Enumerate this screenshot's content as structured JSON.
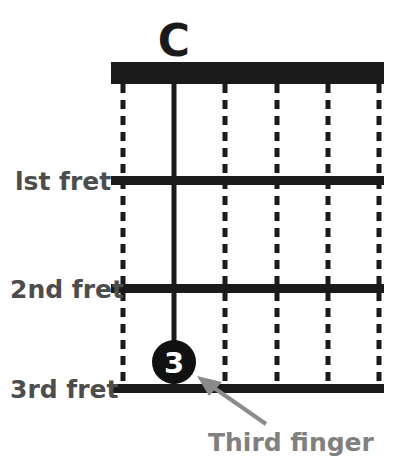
{
  "diagram": {
    "type": "guitar-chord-diagram",
    "chord_name": "C",
    "instrument_strings": 6,
    "frets_shown": 3,
    "colors": {
      "ink": "#1a1a1a",
      "fret_label": "#4d4d4d",
      "annotation": "#808080",
      "dot_fill": "#111111",
      "dot_text": "#ffffff",
      "background": "#ffffff"
    },
    "fret_labels": [
      {
        "id": "fret-1",
        "text": "lst fret"
      },
      {
        "id": "fret-2",
        "text": "2nd fret"
      },
      {
        "id": "fret-3",
        "text": "3rd fret"
      }
    ],
    "finger_markers": [
      {
        "id": "finger-3",
        "label": "3",
        "string": 2,
        "fret": 3
      }
    ],
    "annotations": [
      {
        "id": "third-finger-callout",
        "text": "Third finger",
        "points_to": "finger-3"
      }
    ],
    "nut": {
      "label": "nut",
      "filled": true
    },
    "strings": [
      {
        "index": 1,
        "style": "dashed"
      },
      {
        "index": 2,
        "style": "solid"
      },
      {
        "index": 3,
        "style": "dashed"
      },
      {
        "index": 4,
        "style": "dashed"
      },
      {
        "index": 5,
        "style": "dashed"
      },
      {
        "index": 6,
        "style": "dashed"
      }
    ]
  }
}
